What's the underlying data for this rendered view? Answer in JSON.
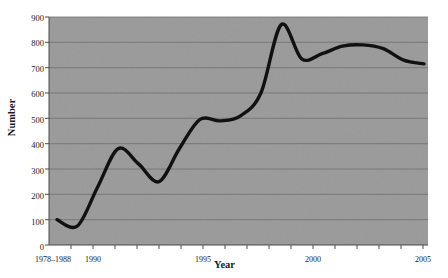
{
  "chart_data": {
    "type": "line",
    "title": "",
    "xlabel": "Year",
    "ylabel": "Number",
    "ylim": [
      0,
      900
    ],
    "ytick_labels": [
      "0",
      "100",
      "200",
      "300",
      "400",
      "500",
      "600",
      "700",
      "800",
      "900"
    ],
    "ytick_values": [
      0,
      100,
      200,
      300,
      400,
      500,
      600,
      700,
      800,
      900
    ],
    "xtick_labels": [
      "1978–1988",
      "1990",
      "1995",
      "2000",
      "2005"
    ],
    "xtick_values": [
      1988,
      1990,
      1995,
      2000,
      2005
    ],
    "grid": "horizontal",
    "legend": "none",
    "plot_background": "#9a9a9a",
    "line_color": "#111111",
    "x": [
      1988,
      1989,
      1990,
      1991,
      1992,
      1993,
      1994,
      1995,
      1996,
      1997,
      1998,
      1999,
      2000,
      2001,
      2002,
      2003,
      2004,
      2005,
      2006
    ],
    "values": [
      100,
      75,
      230,
      380,
      320,
      250,
      380,
      495,
      490,
      510,
      600,
      870,
      735,
      755,
      785,
      790,
      775,
      730,
      715
    ],
    "series": [
      {
        "name": "Number",
        "values": [
          100,
          75,
          230,
          380,
          320,
          250,
          380,
          495,
          490,
          510,
          600,
          870,
          735,
          755,
          785,
          790,
          775,
          730,
          715
        ]
      }
    ],
    "annotations": []
  },
  "figure": {
    "clipped_header_text": "··  ·"
  }
}
